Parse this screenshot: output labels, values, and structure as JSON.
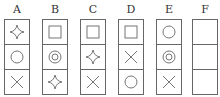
{
  "columns": [
    {
      "label": "A",
      "cells": [
        "star",
        "circle",
        "cross"
      ]
    },
    {
      "label": "B",
      "cells": [
        "square",
        "double-circle",
        "star"
      ]
    },
    {
      "label": "C",
      "cells": [
        "square",
        "star",
        "cross"
      ]
    },
    {
      "label": "D",
      "cells": [
        "square",
        "cross",
        "circle"
      ]
    },
    {
      "label": "E",
      "cells": [
        "circle",
        "double-circle",
        "cross"
      ]
    },
    {
      "label": "F",
      "cells": [
        "",
        "",
        ""
      ]
    }
  ],
  "colors": {
    "stroke": "#666666",
    "text": "#333333"
  }
}
